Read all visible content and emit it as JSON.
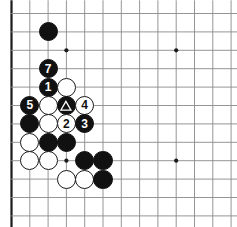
{
  "diagram": {
    "board": {
      "type": "go-board",
      "visible_columns": 13,
      "visible_rows": 12,
      "origin_x": 11.5,
      "origin_y": 13.5,
      "spacing_x": 18.3,
      "spacing_y": 18.4,
      "line_color": "#8a8a8a",
      "edge_color": "#1a1a1a",
      "background_color": "#ffffff",
      "edges": {
        "left": true,
        "top": false,
        "right": false,
        "bottom": true
      },
      "star_points": [
        {
          "col": 3,
          "row": 2
        },
        {
          "col": 9,
          "row": 2
        },
        {
          "col": 3,
          "row": 8
        },
        {
          "col": 9,
          "row": 8
        }
      ]
    },
    "colors": {
      "black_stone": "#111111",
      "white_stone": "#ffffff",
      "stone_outline": "#1a1a1a",
      "black_label": "#ffffff",
      "white_label": "#111111"
    },
    "stones": [
      {
        "col": 2,
        "row": 1,
        "color": "black",
        "label": "",
        "mark": ""
      },
      {
        "col": 2,
        "row": 3,
        "color": "black",
        "label": "7",
        "mark": ""
      },
      {
        "col": 2,
        "row": 4,
        "color": "black",
        "label": "1",
        "mark": ""
      },
      {
        "col": 3,
        "row": 4,
        "color": "white",
        "label": "",
        "mark": ""
      },
      {
        "col": 1,
        "row": 5,
        "color": "black",
        "label": "5",
        "mark": ""
      },
      {
        "col": 2,
        "row": 5,
        "color": "white",
        "label": "",
        "mark": ""
      },
      {
        "col": 3,
        "row": 5,
        "color": "black",
        "label": "",
        "mark": "triangle"
      },
      {
        "col": 4,
        "row": 5,
        "color": "white",
        "label": "4",
        "mark": ""
      },
      {
        "col": 1,
        "row": 6,
        "color": "black",
        "label": "",
        "mark": ""
      },
      {
        "col": 2,
        "row": 6,
        "color": "white",
        "label": "",
        "mark": ""
      },
      {
        "col": 3,
        "row": 6,
        "color": "white",
        "label": "2",
        "mark": ""
      },
      {
        "col": 4,
        "row": 6,
        "color": "black",
        "label": "3",
        "mark": ""
      },
      {
        "col": 1,
        "row": 7,
        "color": "white",
        "label": "",
        "mark": ""
      },
      {
        "col": 2,
        "row": 7,
        "color": "black",
        "label": "",
        "mark": ""
      },
      {
        "col": 3,
        "row": 7,
        "color": "black",
        "label": "",
        "mark": ""
      },
      {
        "col": 1,
        "row": 8,
        "color": "white",
        "label": "",
        "mark": ""
      },
      {
        "col": 2,
        "row": 8,
        "color": "white",
        "label": "",
        "mark": ""
      },
      {
        "col": 4,
        "row": 8,
        "color": "black",
        "label": "",
        "mark": ""
      },
      {
        "col": 5,
        "row": 8,
        "color": "black",
        "label": "",
        "mark": ""
      },
      {
        "col": 3,
        "row": 9,
        "color": "white",
        "label": "",
        "mark": ""
      },
      {
        "col": 4,
        "row": 9,
        "color": "white",
        "label": "",
        "mark": ""
      },
      {
        "col": 5,
        "row": 9,
        "color": "black",
        "label": "",
        "mark": ""
      }
    ],
    "move_sequence": [
      "1",
      "2",
      "3",
      "4",
      "5",
      "7"
    ],
    "marks": {
      "triangle": "triangle-marked-stone"
    }
  }
}
